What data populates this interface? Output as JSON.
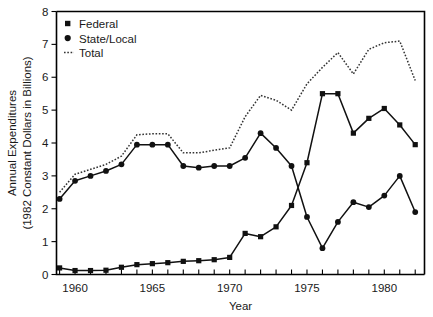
{
  "chart_data": {
    "type": "line",
    "title": "",
    "xlabel": "Year",
    "ylabel": "Annual Expenditures (1982 Constant Dollars in Billions)",
    "ylabel_line1": "Annual Expenditures",
    "ylabel_line2": "(1982 Constant Dollars in Billions)",
    "xlim": [
      1958.8,
      1982.6
    ],
    "ylim": [
      0,
      8
    ],
    "grid": false,
    "legend_position": "top-left",
    "y_ticks": [
      0,
      1,
      2,
      3,
      4,
      5,
      6,
      7,
      8
    ],
    "y_tick_labels": [
      "0",
      "1",
      "2",
      "3",
      "4",
      "5",
      "6",
      "7",
      "8"
    ],
    "x_ticks": [
      1959,
      1960,
      1961,
      1962,
      1963,
      1964,
      1965,
      1966,
      1967,
      1968,
      1969,
      1970,
      1971,
      1972,
      1973,
      1974,
      1975,
      1976,
      1977,
      1978,
      1979,
      1980,
      1981,
      1982
    ],
    "x_tick_labels": [
      {
        "year": 1960,
        "label": "1960"
      },
      {
        "year": 1965,
        "label": "1965"
      },
      {
        "year": 1970,
        "label": "1970"
      },
      {
        "year": 1975,
        "label": "1975"
      },
      {
        "year": 1980,
        "label": "1980"
      }
    ],
    "x": [
      1959,
      1960,
      1961,
      1962,
      1963,
      1964,
      1965,
      1966,
      1967,
      1968,
      1969,
      1970,
      1971,
      1972,
      1973,
      1974,
      1975,
      1976,
      1977,
      1978,
      1979,
      1980,
      1981,
      1982
    ],
    "series": [
      {
        "name": "Federal",
        "marker": "square",
        "linestyle": "solid",
        "color": "#111111",
        "values": [
          0.2,
          0.12,
          0.12,
          0.13,
          0.22,
          0.3,
          0.33,
          0.36,
          0.4,
          0.42,
          0.45,
          0.52,
          1.25,
          1.15,
          1.45,
          2.1,
          3.4,
          5.5,
          5.5,
          4.3,
          4.75,
          5.05,
          4.55,
          3.95
        ]
      },
      {
        "name": "State/Local",
        "marker": "circle",
        "linestyle": "solid",
        "color": "#111111",
        "values": [
          2.3,
          2.85,
          3.0,
          3.15,
          3.35,
          3.95,
          3.95,
          3.95,
          3.3,
          3.25,
          3.3,
          3.3,
          3.55,
          4.3,
          3.85,
          3.3,
          1.75,
          0.8,
          1.6,
          2.2,
          2.05,
          2.4,
          3.0,
          1.9
        ]
      },
      {
        "name": "Total",
        "marker": "none",
        "linestyle": "dotted",
        "color": "#333333",
        "values": [
          2.5,
          3.05,
          3.2,
          3.35,
          3.6,
          4.25,
          4.28,
          4.28,
          3.7,
          3.7,
          3.78,
          3.85,
          4.8,
          5.45,
          5.3,
          5.0,
          5.8,
          6.3,
          6.75,
          6.1,
          6.85,
          7.05,
          7.1,
          5.9
        ]
      }
    ],
    "legend": [
      {
        "label": "Federal",
        "marker": "square"
      },
      {
        "label": "State/Local",
        "marker": "circle"
      },
      {
        "label": "Total",
        "marker": "dotted-line"
      }
    ]
  }
}
